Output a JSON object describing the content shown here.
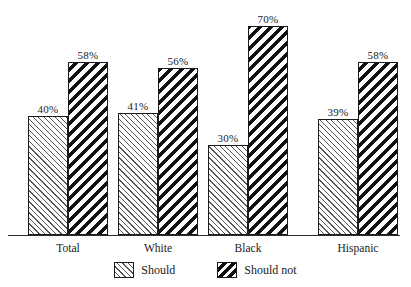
{
  "chart_data": {
    "type": "bar",
    "title": "",
    "subtitle": "",
    "xlabel": "",
    "ylabel": "",
    "ylim": [
      0,
      75
    ],
    "grid": false,
    "legend_position": "bottom-center",
    "value_suffix": "%",
    "categories": [
      "Total",
      "White",
      "Black",
      "Hispanic"
    ],
    "series": [
      {
        "name": "Should",
        "values": [
          40,
          41,
          30,
          39
        ],
        "value_labels": [
          "40%",
          "41%",
          "30%",
          "39%"
        ],
        "pattern": "thin-diagonal-hatch-up",
        "color": "#555555"
      },
      {
        "name": "Should not",
        "values": [
          58,
          56,
          70,
          58
        ],
        "value_labels": [
          "58%",
          "56%",
          "70%",
          "58%"
        ],
        "pattern": "thick-diagonal-hatch-down",
        "color": "#111111"
      }
    ]
  },
  "axis": {
    "baseline_color": "#2b2b2b"
  }
}
